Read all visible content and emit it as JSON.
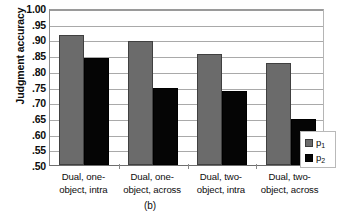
{
  "chart_data": {
    "type": "bar",
    "title": "",
    "caption": "(b)",
    "xlabel": "",
    "ylabel": "Judgment accuracy",
    "ylim": [
      0.5,
      1.0
    ],
    "ytick_labels": [
      "1.00",
      ".95",
      ".90",
      ".85",
      ".80",
      ".75",
      ".70",
      ".65",
      ".60",
      ".55",
      ".50"
    ],
    "ytick_values": [
      1.0,
      0.95,
      0.9,
      0.85,
      0.8,
      0.75,
      0.7,
      0.65,
      0.6,
      0.55,
      0.5
    ],
    "grid": true,
    "legend_position": "right-inside-lower",
    "categories": [
      "Dual, one-object, intra",
      "Dual, one-object, across",
      "Dual, two-object, intra",
      "Dual, two-object, across"
    ],
    "category_lines": [
      [
        "Dual, one-",
        "object, intra"
      ],
      [
        "Dual, one-",
        "object, across"
      ],
      [
        "Dual, two-",
        "object, intra"
      ],
      [
        "Dual, two-",
        "object, across"
      ]
    ],
    "series": [
      {
        "name": "p1",
        "label": "p",
        "subscript": "1",
        "color": "#6b6b6b",
        "values": [
          0.915,
          0.895,
          0.855,
          0.825
        ]
      },
      {
        "name": "p2",
        "label": "p",
        "subscript": "2",
        "color": "#050505",
        "values": [
          0.84,
          0.745,
          0.735,
          0.648
        ]
      }
    ]
  },
  "legend": {
    "items": [
      {
        "label": "p",
        "subscript": "1"
      },
      {
        "label": "p",
        "subscript": "2"
      }
    ]
  }
}
